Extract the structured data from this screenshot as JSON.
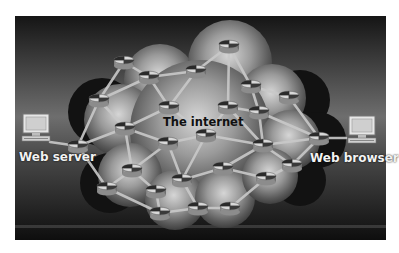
{
  "diagram": {
    "title": "The internet",
    "endpoints": {
      "left": {
        "label": "Web server",
        "icon": "computer-icon"
      },
      "right": {
        "label": "Web browser",
        "icon": "computer-icon"
      }
    },
    "cloud_label": "The internet",
    "node_icon": "router-icon",
    "colors": {
      "background_top": "#1a1a1a",
      "background_mid": "#8a8a8a",
      "cloud_dark": "#111111",
      "cloud_light": "#cfcfcf",
      "link": "#c8c8c8",
      "label_light": "#f2f2f2",
      "label_dark": "#111111"
    },
    "nodes": [
      {
        "id": "n1",
        "x": 124,
        "y": 62
      },
      {
        "id": "n2",
        "x": 149,
        "y": 77
      },
      {
        "id": "n3",
        "x": 196,
        "y": 71
      },
      {
        "id": "n4",
        "x": 229,
        "y": 46
      },
      {
        "id": "n5",
        "x": 251,
        "y": 86
      },
      {
        "id": "n6",
        "x": 289,
        "y": 97
      },
      {
        "id": "n7",
        "x": 99,
        "y": 100
      },
      {
        "id": "n8",
        "x": 169,
        "y": 107
      },
      {
        "id": "n9",
        "x": 228,
        "y": 107
      },
      {
        "id": "n10",
        "x": 259,
        "y": 112
      },
      {
        "id": "n11",
        "x": 125,
        "y": 128
      },
      {
        "id": "n12",
        "x": 206,
        "y": 135
      },
      {
        "id": "n13",
        "x": 168,
        "y": 143
      },
      {
        "id": "n14",
        "x": 319,
        "y": 138
      },
      {
        "id": "n15",
        "x": 78,
        "y": 146
      },
      {
        "id": "n16",
        "x": 263,
        "y": 145
      },
      {
        "id": "n17",
        "x": 292,
        "y": 165
      },
      {
        "id": "n18",
        "x": 132,
        "y": 170
      },
      {
        "id": "n19",
        "x": 182,
        "y": 180
      },
      {
        "id": "n20",
        "x": 223,
        "y": 168
      },
      {
        "id": "n21",
        "x": 266,
        "y": 178
      },
      {
        "id": "n22",
        "x": 107,
        "y": 188
      },
      {
        "id": "n23",
        "x": 156,
        "y": 191
      },
      {
        "id": "n24",
        "x": 160,
        "y": 213
      },
      {
        "id": "n25",
        "x": 198,
        "y": 208
      },
      {
        "id": "n26",
        "x": 230,
        "y": 208
      }
    ],
    "links": [
      [
        "server",
        "n15"
      ],
      [
        "browser",
        "n14"
      ],
      [
        "n1",
        "n2"
      ],
      [
        "n1",
        "n7"
      ],
      [
        "n2",
        "n3"
      ],
      [
        "n2",
        "n7"
      ],
      [
        "n3",
        "n4"
      ],
      [
        "n4",
        "n5"
      ],
      [
        "n4",
        "n9"
      ],
      [
        "n5",
        "n6"
      ],
      [
        "n5",
        "n10"
      ],
      [
        "n6",
        "n14"
      ],
      [
        "n7",
        "n11"
      ],
      [
        "n7",
        "n15"
      ],
      [
        "n8",
        "n12"
      ],
      [
        "n8",
        "n11"
      ],
      [
        "n8",
        "n3"
      ],
      [
        "n9",
        "n10"
      ],
      [
        "n9",
        "n16"
      ],
      [
        "n10",
        "n14"
      ],
      [
        "n10",
        "n16"
      ],
      [
        "n11",
        "n15"
      ],
      [
        "n11",
        "n18"
      ],
      [
        "n11",
        "n13"
      ],
      [
        "n12",
        "n16"
      ],
      [
        "n12",
        "n13"
      ],
      [
        "n12",
        "n19"
      ],
      [
        "n13",
        "n18"
      ],
      [
        "n13",
        "n19"
      ],
      [
        "n14",
        "n16"
      ],
      [
        "n14",
        "n17"
      ],
      [
        "n16",
        "n17"
      ],
      [
        "n15",
        "n22"
      ],
      [
        "n18",
        "n22"
      ],
      [
        "n18",
        "n23"
      ],
      [
        "n19",
        "n20"
      ],
      [
        "n19",
        "n25"
      ],
      [
        "n20",
        "n21"
      ],
      [
        "n20",
        "n16"
      ],
      [
        "n21",
        "n17"
      ],
      [
        "n21",
        "n26"
      ],
      [
        "n22",
        "n24"
      ],
      [
        "n23",
        "n24"
      ],
      [
        "n24",
        "n25"
      ],
      [
        "n25",
        "n26"
      ],
      [
        "n9",
        "n12"
      ],
      [
        "n2",
        "n8"
      ]
    ]
  }
}
